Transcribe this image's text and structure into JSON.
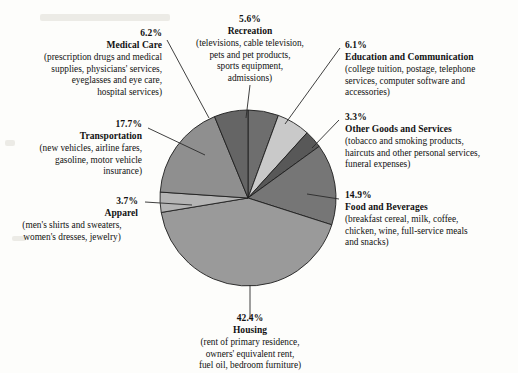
{
  "chart_data": {
    "type": "pie",
    "title": "",
    "units": "percent",
    "legend_position": "callouts",
    "categories": [
      "Recreation",
      "Education and Communication",
      "Other Goods and Services",
      "Food and Beverages",
      "Housing",
      "Apparel",
      "Transportation",
      "Medical Care"
    ],
    "values": [
      5.6,
      6.1,
      3.3,
      14.9,
      42.4,
      3.7,
      17.7,
      6.2
    ],
    "labels": [
      "5.6%",
      "6.1%",
      "3.3%",
      "14.9%",
      "42.4%",
      "3.7%",
      "17.7%",
      "6.2%"
    ],
    "colors": [
      "#6e6e6e",
      "#c9c9c9",
      "#585858",
      "#767676",
      "#9a9a9a",
      "#b4b4b4",
      "#8f8f8f",
      "#656565"
    ],
    "descriptions": [
      "(televisions, cable television, pets and pet products, sports equipment, admissions)",
      "(college tuition, postage, telephone services, computer software and accessories)",
      "(tobacco and smoking products, haircuts and other personal services, funeral expenses)",
      "(breakfast cereal, milk, coffee, chicken, wine, full-service meals and snacks)",
      "(rent of primary residence, owners' equivalent rent, fuel oil, bedroom furniture)",
      "(men's shirts and sweaters, women's dresses, jewelry)",
      "(new vehicles, airline fares, gasoline, motor vehicle insurance)",
      "(prescription drugs and medical supplies, physicians' services, eyeglasses and eye care, hospital services)"
    ]
  },
  "callouts": {
    "recreation": {
      "pct": "5.6%",
      "cat": "Recreation",
      "desc_lines": [
        "(televisions, cable television,",
        "pets and pet products,",
        "sports equipment,",
        "admissions)"
      ]
    },
    "education": {
      "pct": "6.1%",
      "cat": "Education and Communication",
      "desc_lines": [
        "(college tuition, postage, telephone",
        "services, computer software and",
        "accessories)"
      ]
    },
    "other_goods": {
      "pct": "3.3%",
      "cat": "Other Goods and Services",
      "desc_lines": [
        "(tobacco and smoking products,",
        "haircuts and other personal services,",
        "funeral expenses)"
      ]
    },
    "food": {
      "pct": "14.9%",
      "cat": "Food and Beverages",
      "desc_lines": [
        "(breakfast cereal, milk, coffee,",
        "chicken, wine, full-service meals",
        "and snacks)"
      ]
    },
    "housing": {
      "pct": "42.4%",
      "cat": "Housing",
      "desc_lines": [
        "(rent of primary residence,",
        "owners' equivalent rent,",
        "fuel oil, bedroom furniture)"
      ]
    },
    "apparel": {
      "pct": "3.7%",
      "cat": "Apparel",
      "desc_lines": [
        "(men's shirts and sweaters,",
        "women's dresses, jewelry)"
      ]
    },
    "transportation": {
      "pct": "17.7%",
      "cat": "Transportation",
      "desc_lines": [
        "(new vehicles, airline fares,",
        "gasoline, motor vehicle",
        "insurance)"
      ]
    },
    "medical": {
      "pct": "6.2%",
      "cat": "Medical Care",
      "desc_lines": [
        "(prescription drugs and medical",
        "supplies, physicians' services,",
        "eyeglasses and eye care,",
        "hospital services)"
      ]
    }
  }
}
